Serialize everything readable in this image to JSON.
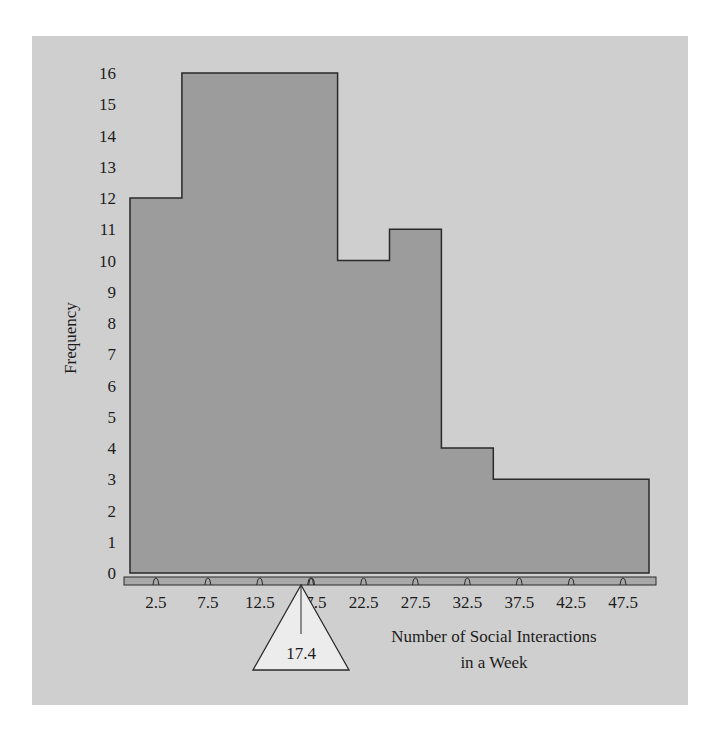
{
  "colors": {
    "page_background": "#ffffff",
    "panel_background": "#cfcfcf",
    "bar_fill": "#9c9c9c",
    "bar_outline": "#2a2a2a",
    "axis_bar_fill": "#a8a8a8",
    "fulcrum_fill": "#ececec",
    "text": "#1c1c1c"
  },
  "chart_data": {
    "type": "bar",
    "title": "",
    "xlabel": "Number of Social Interactions in a Week",
    "xlabel_lines": [
      "Number of Social Interactions",
      "in a Week"
    ],
    "ylabel": "Frequency",
    "categories": [
      "2.5",
      "7.5",
      "12.5",
      "17.5",
      "22.5",
      "27.5",
      "32.5",
      "37.5",
      "42.5",
      "47.5"
    ],
    "bin_edges": [
      0,
      5,
      10,
      15,
      20,
      25,
      30,
      35,
      40,
      45,
      50
    ],
    "values": [
      12,
      16,
      16,
      16,
      10,
      11,
      4,
      3,
      3,
      3
    ],
    "ylim": [
      0,
      16
    ],
    "yticks": [
      "0",
      "1",
      "2",
      "3",
      "4",
      "5",
      "6",
      "7",
      "8",
      "9",
      "10",
      "11",
      "12",
      "13",
      "14",
      "15",
      "16"
    ],
    "grid": false,
    "legend": null,
    "histogram": true,
    "annotations": [
      {
        "type": "fulcrum-triangle",
        "label": "17.4",
        "x": 17.4,
        "meaning": "mean as balance point"
      }
    ]
  }
}
